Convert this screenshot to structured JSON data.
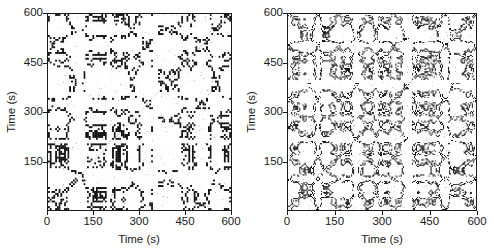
{
  "figure": {
    "background_color": "#ffffff",
    "foreground_color": "#1a1a1a",
    "panel_count": 2
  },
  "chart_data": [
    {
      "type": "heatmap",
      "subtype": "recurrence-plot",
      "panel": "left",
      "title": "",
      "xlabel": "Time (s)",
      "ylabel": "Time (s)",
      "xlim": [
        0,
        600
      ],
      "ylim": [
        0,
        600
      ],
      "xticks": [
        0,
        150,
        300,
        450,
        600
      ],
      "yticks": [
        150,
        300,
        450,
        600
      ],
      "xticklabels": [
        "0",
        "150",
        "300",
        "450",
        "600"
      ],
      "yticklabels": [
        "150",
        "300",
        "450",
        "600"
      ],
      "grid": false,
      "legend": false,
      "colors": {
        "recurrent": "#1a1a1a",
        "non_recurrent": "#ffffff"
      },
      "texture": {
        "description": "Coarse highly-periodic block-checkerboard recurrence structure with symmetric lobed motifs; strong horizontal and vertical disruption bands.",
        "seed": 20417,
        "period_x": 150,
        "period_y": 150,
        "density": 0.3,
        "cell_scale": 3.1,
        "blob_scale": 1.0,
        "band_times_x": [
          196,
          350
        ],
        "band_times_y": [
          205,
          352
        ],
        "symmetric": true
      }
    },
    {
      "type": "heatmap",
      "subtype": "recurrence-plot",
      "panel": "right",
      "title": "",
      "xlabel": "Time (s)",
      "ylabel": "Time (s)",
      "xlim": [
        0,
        600
      ],
      "ylim": [
        0,
        600
      ],
      "xticks": [
        0,
        150,
        300,
        450,
        600
      ],
      "yticks": [
        150,
        300,
        450,
        600
      ],
      "xticklabels": [
        "0",
        "150",
        "300",
        "450",
        "600"
      ],
      "yticklabels": [
        "150",
        "300",
        "450",
        "600"
      ],
      "grid": false,
      "legend": false,
      "colors": {
        "recurrent": "#1a1a1a",
        "non_recurrent": "#ffffff"
      },
      "texture": {
        "description": "Finer, denser, less regular recurrence texture with short horizontal line segments; prominent white vertical and horizontal discontinuity band near 390 s.",
        "seed": 91733,
        "period_x": 82,
        "period_y": 78,
        "density": 0.34,
        "cell_scale": 1.75,
        "blob_scale": 0.62,
        "band_times_x": [
          390
        ],
        "band_times_y": [
          393
        ],
        "symmetric": true
      }
    }
  ],
  "panels": [
    {
      "name": "left",
      "axis_x": {
        "title": "Time (s)",
        "ticks": [
          "0",
          "150",
          "300",
          "450",
          "600"
        ]
      },
      "axis_y": {
        "title": "Time (s)",
        "ticks": [
          "150",
          "300",
          "450",
          "600"
        ]
      }
    },
    {
      "name": "right",
      "axis_x": {
        "title": "Time (s)",
        "ticks": [
          "0",
          "150",
          "300",
          "450",
          "600"
        ]
      },
      "axis_y": {
        "title": "Time (s)",
        "ticks": [
          "150",
          "300",
          "450",
          "600"
        ]
      }
    }
  ]
}
